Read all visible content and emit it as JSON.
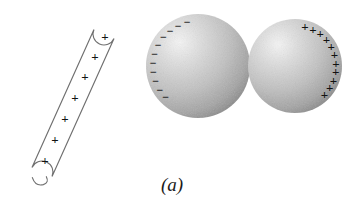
{
  "figure": {
    "caption": "(a)",
    "background_color": "#ffffff",
    "width": 357,
    "height": 211
  },
  "rod": {
    "name": "charged glass rod",
    "charge_symbol": "+",
    "charge_count": 7,
    "outline_color": "#6f6f6f",
    "fill_color": "#ffffff",
    "sign_color": "#111111",
    "signs": [
      {
        "label": "+",
        "x": 45,
        "y": 160
      },
      {
        "label": "+",
        "x": 55,
        "y": 139
      },
      {
        "label": "+",
        "x": 65,
        "y": 118
      },
      {
        "label": "+",
        "x": 75,
        "y": 97
      },
      {
        "label": "+",
        "x": 85,
        "y": 76
      },
      {
        "label": "+",
        "x": 95,
        "y": 56
      },
      {
        "label": "+",
        "x": 105,
        "y": 36
      }
    ],
    "axis": {
      "x1": 42,
      "y1": 172,
      "x2": 104,
      "y2": 34
    },
    "half_width": 11
  },
  "sphere_left": {
    "name": "left conducting sphere",
    "charge_symbol": "−",
    "charge_count": 11,
    "charge_label": "negative",
    "cx": 198,
    "cy": 66,
    "r": 52,
    "highlight_color": "#f2f2f2",
    "mid_color": "#bdbdbd",
    "edge_color": "#8e8e8e",
    "sign_color": "#111111",
    "signs": [
      {
        "label": "−",
        "angle": 256
      },
      {
        "label": "−",
        "angle": 244
      },
      {
        "label": "−",
        "angle": 232
      },
      {
        "label": "−",
        "angle": 220
      },
      {
        "label": "−",
        "angle": 208
      },
      {
        "label": "−",
        "angle": 196
      },
      {
        "label": "−",
        "angle": 184
      },
      {
        "label": "−",
        "angle": 172
      },
      {
        "label": "−",
        "angle": 160
      },
      {
        "label": "−",
        "angle": 148
      },
      {
        "label": "−",
        "angle": 136
      }
    ]
  },
  "sphere_right": {
    "name": "right conducting sphere",
    "charge_symbol": "+",
    "charge_count": 11,
    "charge_label": "positive",
    "cx": 295,
    "cy": 66,
    "r": 47,
    "highlight_color": "#f2f2f2",
    "mid_color": "#bdbdbd",
    "edge_color": "#8e8e8e",
    "sign_color": "#111111",
    "signs": [
      {
        "label": "+",
        "angle": 284
      },
      {
        "label": "+",
        "angle": 296
      },
      {
        "label": "+",
        "angle": 308
      },
      {
        "label": "+",
        "angle": 320
      },
      {
        "label": "+",
        "angle": 332
      },
      {
        "label": "+",
        "angle": 344
      },
      {
        "label": "+",
        "angle": 356
      },
      {
        "label": "+",
        "angle": 8
      },
      {
        "label": "+",
        "angle": 20
      },
      {
        "label": "+",
        "angle": 32
      },
      {
        "label": "+",
        "angle": 44
      }
    ]
  },
  "caption": {
    "text": "(a)",
    "x": 172,
    "y": 191,
    "color": "#1a1a1a"
  }
}
